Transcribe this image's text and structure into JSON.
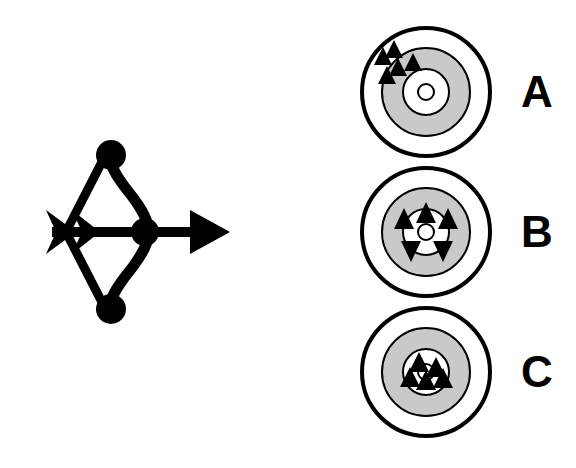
{
  "figure": {
    "title": "",
    "background_color": "#ffffff",
    "ink_color": "#000000",
    "ring_gray_color": "#c9c9c9"
  },
  "bow": {
    "icon_name": "bow-and-arrow-icon",
    "description": "Black silhouette of a recurve bow with nocked arrow pointing right",
    "color": "#000000"
  },
  "targets": [
    {
      "id": "A",
      "label": "A",
      "icon_name": "target-concentric-circles",
      "rings": 4,
      "ring_colors": [
        "#ffffff",
        "#c9c9c9",
        "#ffffff",
        "#ffffff"
      ],
      "arrow_count": 5,
      "arrow_grouping": "tight-cluster",
      "arrow_location": "upper-left-outer-ring",
      "arrow_marks": [
        {
          "x": 27,
          "y": 37,
          "rot": 0
        },
        {
          "x": 37,
          "y": 28,
          "rot": 0
        },
        {
          "x": 41,
          "y": 44,
          "rot": 0
        },
        {
          "x": 34,
          "y": 51,
          "rot": 0
        },
        {
          "x": 53,
          "y": 42,
          "rot": 0
        }
      ]
    },
    {
      "id": "B",
      "label": "B",
      "icon_name": "target-concentric-circles",
      "rings": 4,
      "ring_colors": [
        "#ffffff",
        "#c9c9c9",
        "#ffffff",
        "#ffffff"
      ],
      "arrow_count": 5,
      "arrow_grouping": "spread-ring",
      "arrow_location": "around-bullseye",
      "arrow_marks": [
        {
          "x": 70,
          "y": 48,
          "rot": 0
        },
        {
          "x": 49,
          "y": 58,
          "rot": 0
        },
        {
          "x": 91,
          "y": 58,
          "rot": 0
        },
        {
          "x": 57,
          "y": 86,
          "rot": 180
        },
        {
          "x": 85,
          "y": 86,
          "rot": 180
        }
      ]
    },
    {
      "id": "C",
      "label": "C",
      "icon_name": "target-concentric-circles",
      "rings": 4,
      "ring_colors": [
        "#ffffff",
        "#c9c9c9",
        "#ffffff",
        "#ffffff"
      ],
      "arrow_count": 5,
      "arrow_grouping": "tight-cluster",
      "arrow_location": "bullseye-center",
      "arrow_marks": [
        {
          "x": 63,
          "y": 58,
          "rot": 0
        },
        {
          "x": 78,
          "y": 62,
          "rot": 0
        },
        {
          "x": 55,
          "y": 72,
          "rot": 0
        },
        {
          "x": 70,
          "y": 74,
          "rot": 0
        },
        {
          "x": 84,
          "y": 72,
          "rot": 0
        }
      ]
    }
  ]
}
